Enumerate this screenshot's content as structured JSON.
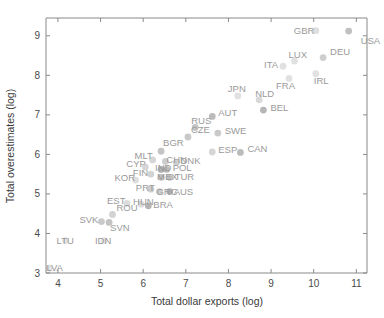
{
  "chart_data": {
    "type": "scatter",
    "title": "",
    "xlabel": "Total dollar exports (log)",
    "ylabel": "Total overestimates (log)",
    "xlim": [
      3.72,
      11.25
    ],
    "ylim": [
      3.0,
      9.45
    ],
    "xticks": [
      4,
      5,
      6,
      7,
      8,
      9,
      10,
      11
    ],
    "yticks": [
      3,
      4,
      5,
      6,
      7,
      8,
      9
    ],
    "grid": false,
    "legend": null,
    "marker_color": "#8c8c8c",
    "label_color": "#9a9a9a",
    "axis_color": "#8a8a8a",
    "points": [
      {
        "label": "USA",
        "x": 10.82,
        "y": 9.12,
        "shade": 0.45,
        "lx": 12,
        "ly": 13
      },
      {
        "label": "GBR",
        "x": 10.05,
        "y": 9.13,
        "shade": 0.12,
        "lx": -22,
        "ly": 3
      },
      {
        "label": "DEU",
        "x": 10.22,
        "y": 8.45,
        "shade": 0.3,
        "lx": 7,
        "ly": -3
      },
      {
        "label": "LUX",
        "x": 9.55,
        "y": 8.36,
        "shade": 0.1,
        "lx": -6,
        "ly": -3
      },
      {
        "label": "ITA",
        "x": 9.28,
        "y": 8.23,
        "shade": 0.1,
        "lx": -19,
        "ly": 2
      },
      {
        "label": "IRL",
        "x": 10.05,
        "y": 8.04,
        "shade": 0.1,
        "lx": -2,
        "ly": 10
      },
      {
        "label": "FRA",
        "x": 9.42,
        "y": 7.92,
        "shade": 0.1,
        "lx": -13,
        "ly": 11
      },
      {
        "label": "NLD",
        "x": 8.72,
        "y": 7.38,
        "shade": 0.18,
        "lx": -4,
        "ly": -3
      },
      {
        "label": "BEL",
        "x": 8.82,
        "y": 7.12,
        "shade": 0.55,
        "lx": 7,
        "ly": 1
      },
      {
        "label": "JPN",
        "x": 8.22,
        "y": 7.48,
        "shade": 0.1,
        "lx": -10,
        "ly": -4
      },
      {
        "label": "AUT",
        "x": 7.62,
        "y": 6.96,
        "shade": 0.5,
        "lx": 6,
        "ly": 0
      },
      {
        "label": "RUS",
        "x": 7.22,
        "y": 6.68,
        "shade": 0.4,
        "lx": -4,
        "ly": -4
      },
      {
        "label": "SWE",
        "x": 7.75,
        "y": 6.54,
        "shade": 0.35,
        "lx": 7,
        "ly": 1
      },
      {
        "label": "CZE",
        "x": 7.05,
        "y": 6.44,
        "shade": 0.35,
        "lx": 3,
        "ly": -4
      },
      {
        "label": "ESP",
        "x": 7.62,
        "y": 6.06,
        "shade": 0.22,
        "lx": 6,
        "ly": 1
      },
      {
        "label": "CAN",
        "x": 8.28,
        "y": 6.05,
        "shade": 0.5,
        "lx": 7,
        "ly": 0
      },
      {
        "label": "BGR",
        "x": 6.42,
        "y": 6.08,
        "shade": 0.4,
        "lx": 2,
        "ly": -5
      },
      {
        "label": "MLT",
        "x": 6.22,
        "y": 5.86,
        "shade": 0.22,
        "lx": -18,
        "ly": -1
      },
      {
        "label": "CHN",
        "x": 6.52,
        "y": 5.82,
        "shade": 0.3,
        "lx": 1,
        "ly": 1
      },
      {
        "label": "DNK",
        "x": 6.78,
        "y": 5.8,
        "shade": 0.3,
        "lx": 4,
        "ly": 2
      },
      {
        "label": "CYP",
        "x": 6.05,
        "y": 5.68,
        "shade": 0.22,
        "lx": -19,
        "ly": 0
      },
      {
        "label": "IND",
        "x": 6.42,
        "y": 5.62,
        "shade": 0.62,
        "lx": -6,
        "ly": 2
      },
      {
        "label": "POL",
        "x": 6.55,
        "y": 5.62,
        "shade": 0.5,
        "lx": 6,
        "ly": 2
      },
      {
        "label": "FIN",
        "x": 6.18,
        "y": 5.5,
        "shade": 0.25,
        "lx": -18,
        "ly": 2
      },
      {
        "label": "MEX",
        "x": 6.42,
        "y": 5.42,
        "shade": 0.45,
        "lx": -4,
        "ly": 3
      },
      {
        "label": "TUR",
        "x": 6.62,
        "y": 5.42,
        "shade": 0.45,
        "lx": 5,
        "ly": 3
      },
      {
        "label": "KOR",
        "x": 5.82,
        "y": 5.35,
        "shade": 0.12,
        "lx": -21,
        "ly": 1
      },
      {
        "label": "PRT",
        "x": 6.18,
        "y": 5.12,
        "shade": 0.3,
        "lx": -15,
        "ly": 2
      },
      {
        "label": "GRC",
        "x": 6.38,
        "y": 5.06,
        "shade": 0.3,
        "lx": -3,
        "ly": 3
      },
      {
        "label": "RUS2",
        "x": 6.62,
        "y": 5.06,
        "shade": 0.62,
        "lx": 4,
        "ly": 3
      },
      {
        "label": "EST",
        "x": 5.62,
        "y": 4.76,
        "shade": 0.15,
        "lx": -20,
        "ly": 1
      },
      {
        "label": "HUN",
        "x": 5.95,
        "y": 4.74,
        "shade": 0.15,
        "lx": -8,
        "ly": 1
      },
      {
        "label": "BRA",
        "x": 6.12,
        "y": 4.7,
        "shade": 0.58,
        "lx": 5,
        "ly": 2
      },
      {
        "label": "ROU",
        "x": 5.28,
        "y": 4.48,
        "shade": 0.25,
        "lx": 4,
        "ly": -3
      },
      {
        "label": "SVK",
        "x": 5.02,
        "y": 4.3,
        "shade": 0.35,
        "lx": -22,
        "ly": 1
      },
      {
        "label": "SVN",
        "x": 5.2,
        "y": 4.28,
        "shade": 0.4,
        "lx": 1,
        "ly": 9
      },
      {
        "label": "LTU",
        "x": 4.18,
        "y": 3.82,
        "shade": 0.08,
        "lx": -9,
        "ly": 3
      },
      {
        "label": "IDN",
        "x": 5.08,
        "y": 3.82,
        "shade": 0.08,
        "lx": -9,
        "ly": 3
      },
      {
        "label": "LVA",
        "x": 3.8,
        "y": 3.12,
        "shade": 0.08,
        "lx": -3,
        "ly": 3
      }
    ]
  }
}
